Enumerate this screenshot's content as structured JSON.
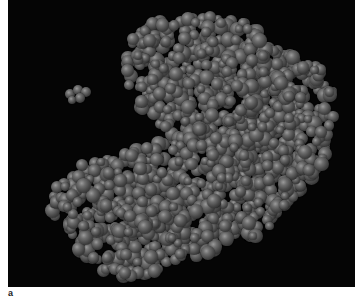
{
  "figure": {
    "panel_label": "a",
    "background_color": "#050505",
    "atom_color": "#6e6e6e"
  }
}
